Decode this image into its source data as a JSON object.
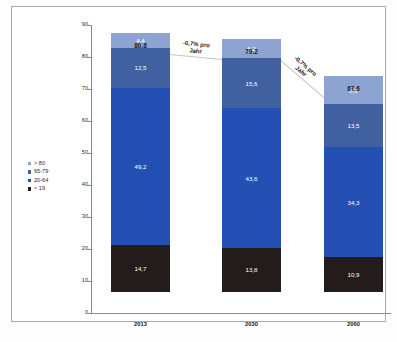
{
  "chart_data": {
    "type": "bar",
    "subtype": "stacked-column",
    "title": "",
    "xlabel": "",
    "ylabel": "",
    "categories": [
      "2013",
      "2030",
      "2060"
    ],
    "ylim": [
      0,
      90
    ],
    "yticks": [
      0,
      10,
      20,
      30,
      40,
      50,
      60,
      70,
      80,
      90
    ],
    "grid": false,
    "legend_position": "left",
    "series": [
      {
        "name": "< 19",
        "color": "#241c1a",
        "values": [
          14.7,
          13.8,
          10.9
        ],
        "value_labels": [
          "14,7",
          "13,8",
          "10,9"
        ]
      },
      {
        "name": "20-64",
        "color": "#2450b4",
        "values": [
          49.2,
          43.6,
          34.3
        ],
        "value_labels": [
          "49,2",
          "43,6",
          "34,3"
        ]
      },
      {
        "name": "65-79",
        "color": "#41609f",
        "values": [
          12.5,
          15.6,
          13.5
        ],
        "value_labels": [
          "12,5",
          "15,6",
          "13,5"
        ]
      },
      {
        "name": "> 80",
        "color": "#8da4d2",
        "values": [
          4.4,
          6.2,
          8.8
        ],
        "value_labels": [
          "4,4",
          "6,2",
          "8,8"
        ]
      }
    ],
    "totals": [
      80.8,
      79.2,
      67.6
    ],
    "total_labels": [
      "80.8",
      "79.2",
      "67.6"
    ],
    "annotations": [
      {
        "text": "-0,7% pro\nJahr",
        "between": [
          "2013",
          "2030"
        ]
      },
      {
        "text": "-0,7% pro\nJahr",
        "between": [
          "2030",
          "2060"
        ]
      }
    ]
  },
  "legend": {
    "items": [
      {
        "label": "> 80",
        "color": "#8da4d2"
      },
      {
        "label": "65-79",
        "color": "#41609f"
      },
      {
        "label": "20-64",
        "color": "#2450b4"
      },
      {
        "label": "< 19",
        "color": "#241c1a"
      }
    ]
  },
  "axis": {
    "y_tick_labels": [
      "90",
      "80",
      "70",
      "60",
      "50",
      "40",
      "30",
      "20",
      "10",
      "0"
    ]
  },
  "caption": {
    "text": ""
  }
}
